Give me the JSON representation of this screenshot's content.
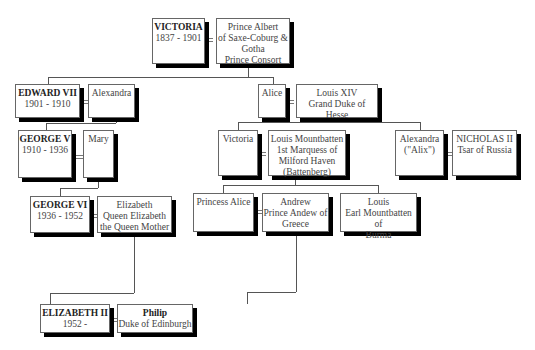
{
  "people": {
    "victoria": {
      "name": "VICTORIA",
      "lines": [
        "1837 - 1901"
      ]
    },
    "albert": {
      "lines": [
        "Prince Albert",
        "of Saxe-Coburg &",
        "Gotha",
        "Prince Consort"
      ]
    },
    "edward7": {
      "name": "EDWARD VII",
      "lines": [
        "1901 - 1910"
      ]
    },
    "alexandra": {
      "lines": [
        "Alexandra"
      ]
    },
    "alice": {
      "lines": [
        "Alice"
      ]
    },
    "louis14": {
      "lines": [
        "Louis XIV",
        "Grand Duke of Hesse"
      ]
    },
    "george5": {
      "name": "GEORGE V",
      "lines": [
        "1910 - 1936"
      ]
    },
    "mary": {
      "lines": [
        "Mary"
      ]
    },
    "victoria2": {
      "lines": [
        "Victoria"
      ]
    },
    "louis_mountbatten": {
      "lines": [
        "Louis Mountbatten",
        "1st Marquess of",
        "Milford Haven",
        "(Battenberg)"
      ]
    },
    "alexandra_alix": {
      "lines": [
        "Alexandra",
        "(\"Alix\")"
      ]
    },
    "nicholas2": {
      "name": "NICHOLAS II",
      "lines": [
        "Tsar of Russia"
      ]
    },
    "george6": {
      "name": "GEORGE VI",
      "lines": [
        "1936 - 1952"
      ]
    },
    "elizabeth_qm": {
      "lines": [
        "Elizabeth",
        "Queen Elizabeth",
        "the Queen Mother"
      ]
    },
    "princess_alice": {
      "lines": [
        "Princess Alice"
      ]
    },
    "andrew": {
      "lines": [
        "Andrew",
        "Prince Andew of",
        "Greece"
      ]
    },
    "louis_earl": {
      "lines": [
        "Louis",
        "Earl Mountbatten of",
        "Burma"
      ]
    },
    "elizabeth2": {
      "name": "ELIZABETH II",
      "lines": [
        "1952 -"
      ]
    },
    "philip": {
      "name": "Philip",
      "lines": [
        "Duke of Edinburgh"
      ]
    }
  }
}
